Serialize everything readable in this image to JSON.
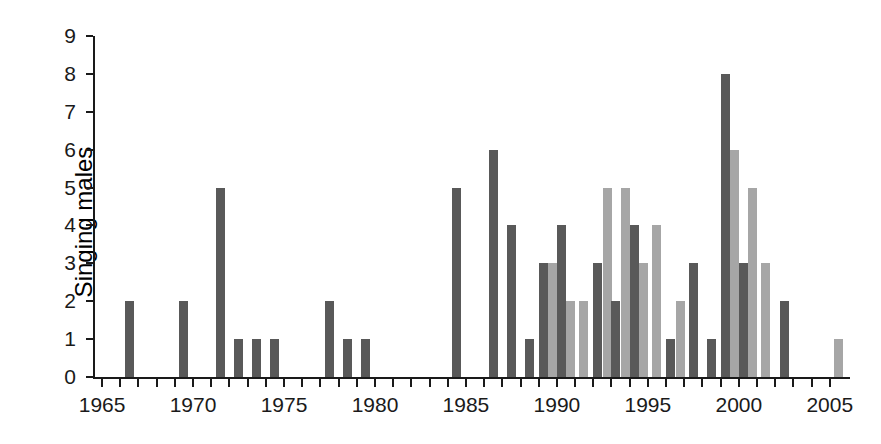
{
  "chart_data": {
    "type": "bar",
    "title": "",
    "xlabel": "",
    "ylabel": "Singing males",
    "xlim": [
      1964.5,
      2006.0
    ],
    "ylim": [
      0,
      9
    ],
    "grid": false,
    "legend": null,
    "yticks": [
      0,
      1,
      2,
      3,
      4,
      5,
      6,
      7,
      8,
      9
    ],
    "ytick_labels": [
      "0",
      "1",
      "2",
      "3",
      "4",
      "5",
      "6",
      "7",
      "8",
      "9"
    ],
    "xticks": [
      1965,
      1966,
      1967,
      1968,
      1969,
      1970,
      1971,
      1972,
      1973,
      1974,
      1975,
      1976,
      1977,
      1978,
      1979,
      1980,
      1981,
      1982,
      1983,
      1984,
      1985,
      1986,
      1987,
      1988,
      1989,
      1990,
      1991,
      1992,
      1993,
      1994,
      1995,
      1996,
      1997,
      1998,
      1999,
      2000,
      2001,
      2002,
      2003,
      2004,
      2005
    ],
    "xtick_labels_major": [
      "1965",
      "1970",
      "1975",
      "1980",
      "1985",
      "1990",
      "1995",
      "2000",
      "2005"
    ],
    "xtick_major_values": [
      1965,
      1970,
      1975,
      1980,
      1985,
      1990,
      1995,
      2000,
      2005
    ],
    "colors": {
      "dark": "#595959",
      "light": "#a6a6a6",
      "axis": "#1a1a1a",
      "background": "#ffffff"
    },
    "series": [
      {
        "name": "dark-series",
        "color": "#595959",
        "points": [
          {
            "x": 1966,
            "y": 2
          },
          {
            "x": 1969,
            "y": 2
          },
          {
            "x": 1971,
            "y": 5
          },
          {
            "x": 1972,
            "y": 1
          },
          {
            "x": 1973,
            "y": 1
          },
          {
            "x": 1974,
            "y": 1
          },
          {
            "x": 1977,
            "y": 2
          },
          {
            "x": 1978,
            "y": 1
          },
          {
            "x": 1979,
            "y": 1
          },
          {
            "x": 1984,
            "y": 5
          },
          {
            "x": 1986,
            "y": 6
          },
          {
            "x": 1987,
            "y": 4
          },
          {
            "x": 1988,
            "y": 1
          },
          {
            "x": 1989,
            "y": 3
          },
          {
            "x": 1990,
            "y": 4
          },
          {
            "x": 1992,
            "y": 3
          },
          {
            "x": 1993,
            "y": 2
          },
          {
            "x": 1994,
            "y": 4
          },
          {
            "x": 1996,
            "y": 1
          },
          {
            "x": 1997,
            "y": 3
          },
          {
            "x": 1998,
            "y": 1
          },
          {
            "x": 1999,
            "y": 8
          },
          {
            "x": 2000,
            "y": 3
          },
          {
            "x": 2002,
            "y": 2
          }
        ]
      },
      {
        "name": "light-series",
        "color": "#a6a6a6",
        "points": [
          {
            "x": 1989,
            "y": 3
          },
          {
            "x": 1990,
            "y": 2
          },
          {
            "x": 1991,
            "y": 2
          },
          {
            "x": 1992,
            "y": 5
          },
          {
            "x": 1993,
            "y": 5
          },
          {
            "x": 1994,
            "y": 3
          },
          {
            "x": 1995,
            "y": 4
          },
          {
            "x": 1996,
            "y": 2
          },
          {
            "x": 1999,
            "y": 6
          },
          {
            "x": 2000,
            "y": 5
          },
          {
            "x": 2001,
            "y": 3
          },
          {
            "x": 2005,
            "y": 1
          }
        ]
      }
    ]
  }
}
